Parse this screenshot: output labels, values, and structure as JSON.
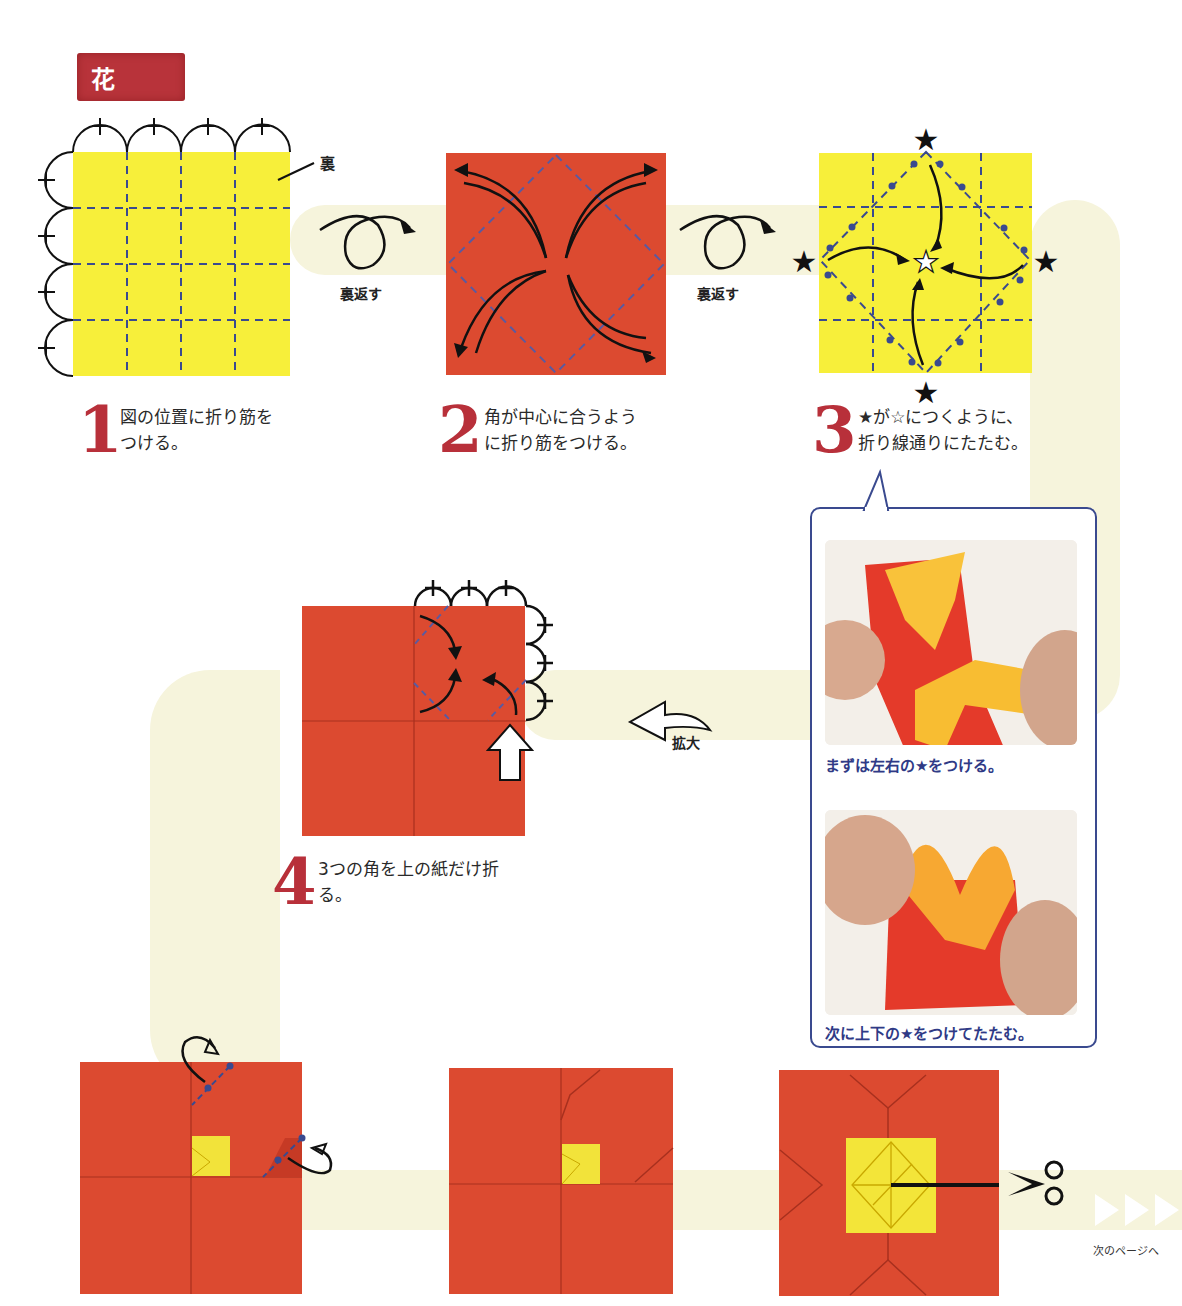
{
  "header": {
    "title": "花"
  },
  "colors": {
    "accent_red": "#b8303a",
    "paper_red": "#dc4a30",
    "paper_yellow": "#f7ef3a",
    "crease_blue": "#3a4a8f",
    "band": "#f6f4dc"
  },
  "steps": [
    {
      "number": "1",
      "line1": "図の位置に折り筋を",
      "line2": "つける。"
    },
    {
      "number": "2",
      "line1": "角が中心に合うよう",
      "line2": "に折り筋をつける。"
    },
    {
      "number": "3",
      "line1": "★が☆につくように、",
      "line2": "折り線通りにたたむ。"
    },
    {
      "number": "4",
      "line1": "3つの角を上の紙だけ折",
      "line2": "る。"
    }
  ],
  "diagram_labels": {
    "back_side": "裏",
    "flip_over_1": "裏返す",
    "flip_over_2": "裏返す",
    "zoom_in": "拡大"
  },
  "detail_box": {
    "photo1_caption": "まずは左右の★をつける。",
    "photo2_caption": "次に上下の★をつけてたたむ。"
  },
  "footer": {
    "next_page": "次のページへ"
  },
  "icons": {
    "flip": "loop-arrow-icon",
    "zoom": "curved-left-arrow-icon",
    "cut": "scissors-icon",
    "next": "triple-triangle-icon",
    "star_filled": "★",
    "star_outline": "☆"
  }
}
